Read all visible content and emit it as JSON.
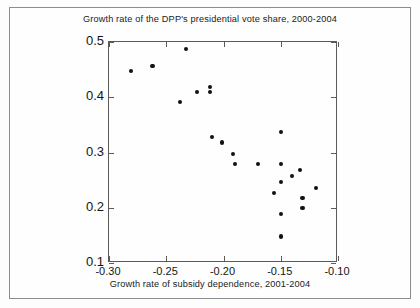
{
  "chart_data": {
    "type": "scatter",
    "title": "Growth rate of the DPP's presidential vote share, 2000-2004",
    "xlabel": "Growth rate of subsidy dependence, 2001-2004",
    "ylabel": "",
    "xlim": [
      -0.3,
      -0.1
    ],
    "ylim": [
      0.1,
      0.5
    ],
    "xticks": [
      "-0.30",
      "-0.25",
      "-0.20",
      "-0.15",
      "-0.10"
    ],
    "xtick_values": [
      -0.3,
      -0.25,
      -0.2,
      -0.15,
      -0.1
    ],
    "yticks": [
      "0.5",
      "0.4",
      "0.3",
      "0.2",
      "0.1"
    ],
    "ytick_values": [
      0.5,
      0.4,
      0.3,
      0.2,
      0.1
    ],
    "grid": false,
    "legend": null,
    "marker": "filled-circle",
    "marker_color": "#111111",
    "points": [
      {
        "x": -0.281,
        "y": 0.448
      },
      {
        "x": -0.262,
        "y": 0.456
      },
      {
        "x": -0.238,
        "y": 0.391
      },
      {
        "x": -0.233,
        "y": 0.488
      },
      {
        "x": -0.223,
        "y": 0.409
      },
      {
        "x": -0.212,
        "y": 0.418
      },
      {
        "x": -0.212,
        "y": 0.41
      },
      {
        "x": -0.21,
        "y": 0.328
      },
      {
        "x": -0.201,
        "y": 0.318
      },
      {
        "x": -0.192,
        "y": 0.298
      },
      {
        "x": -0.19,
        "y": 0.279
      },
      {
        "x": -0.17,
        "y": 0.279
      },
      {
        "x": -0.156,
        "y": 0.227
      },
      {
        "x": -0.15,
        "y": 0.337
      },
      {
        "x": -0.15,
        "y": 0.279
      },
      {
        "x": -0.15,
        "y": 0.247
      },
      {
        "x": -0.15,
        "y": 0.189
      },
      {
        "x": -0.15,
        "y": 0.148
      },
      {
        "x": -0.14,
        "y": 0.257
      },
      {
        "x": -0.133,
        "y": 0.268
      },
      {
        "x": -0.131,
        "y": 0.217
      },
      {
        "x": -0.131,
        "y": 0.199
      },
      {
        "x": -0.119,
        "y": 0.236
      }
    ]
  }
}
